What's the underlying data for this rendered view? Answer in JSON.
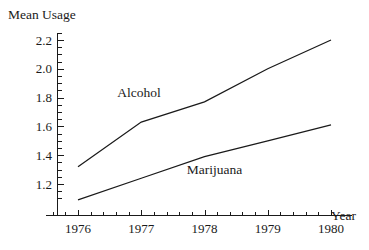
{
  "chart_data": {
    "type": "line",
    "title": "",
    "xlabel": "Year",
    "ylabel": "Mean Usage",
    "x": [
      1976,
      1977,
      1978,
      1979,
      1980
    ],
    "xtick_labels": [
      "1976",
      "1977",
      "1978",
      "1979",
      "1980"
    ],
    "ytick_labels": [
      "1.2",
      "1.4",
      "1.6",
      "1.8",
      "2.0",
      "2.2"
    ],
    "ytick_values": [
      1.2,
      1.4,
      1.6,
      1.8,
      2.0,
      2.2
    ],
    "xlim": [
      1975.67,
      1980.0
    ],
    "ylim": [
      1.04,
      2.28
    ],
    "grid": false,
    "legend": "inline-labels",
    "minor_ticks_per_interval": 5,
    "series": [
      {
        "name": "Alcohol",
        "values": [
          1.32,
          1.63,
          1.77,
          2.0,
          2.2
        ],
        "color": "#1a1a1a",
        "label_x": 1977.0,
        "label_y": 1.83
      },
      {
        "name": "Marijuana",
        "values": [
          1.09,
          1.24,
          1.39,
          1.5,
          1.61
        ],
        "color": "#1a1a1a",
        "label_x": 1978.1,
        "label_y": 1.3
      }
    ]
  },
  "axes": {
    "y_axis_title": "Mean Usage",
    "x_axis_title": "Year"
  },
  "colors": {
    "ink": "#1a1a1a",
    "background": "#ffffff"
  }
}
